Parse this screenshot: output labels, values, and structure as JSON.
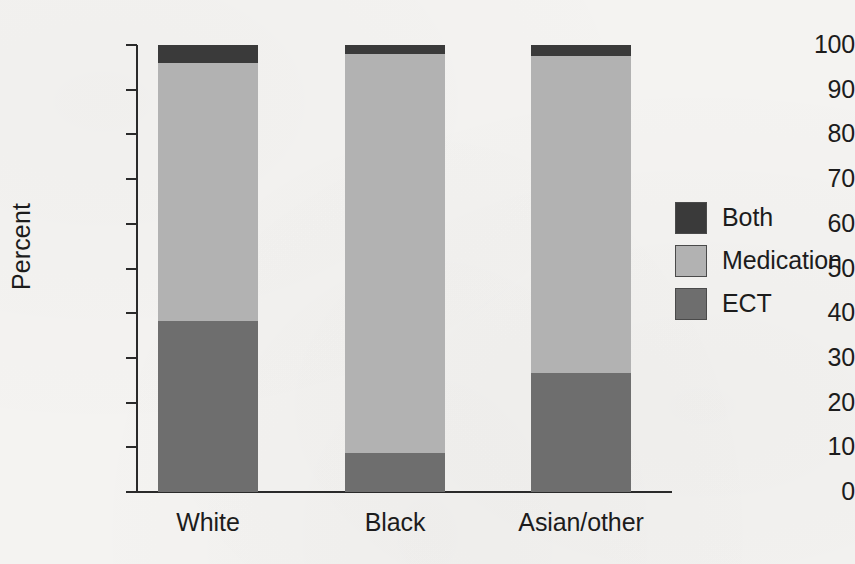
{
  "chart_data": {
    "type": "bar",
    "subtype": "stacked-bar-100",
    "title": "",
    "xlabel": "",
    "ylabel": "Percent",
    "ylim": [
      0,
      100
    ],
    "yticks": [
      0,
      10,
      20,
      30,
      40,
      50,
      60,
      70,
      80,
      90,
      100
    ],
    "ytick_labels": [
      "0",
      "10",
      "20",
      "30",
      "40",
      "50",
      "60",
      "70",
      "80",
      "90",
      "100"
    ],
    "grid": false,
    "legend_position": "right",
    "categories": [
      "White",
      "Black",
      "Asian/other"
    ],
    "series": [
      {
        "name": "ECT",
        "values": [
          38.3,
          8.7,
          26.6
        ],
        "color": "#6e6e6e"
      },
      {
        "name": "Medication",
        "values": [
          57.7,
          89.3,
          70.9
        ],
        "color": "#b2b2b2"
      },
      {
        "name": "Both",
        "values": [
          4.0,
          2.0,
          2.5
        ],
        "color": "#3a3a3a"
      }
    ],
    "stack_order_bottom_to_top": [
      "ECT",
      "Medication",
      "Both"
    ],
    "annotations": []
  },
  "legend": {
    "items": [
      {
        "label": "Both",
        "color": "#3a3a3a"
      },
      {
        "label": "Medication",
        "color": "#b2b2b2"
      },
      {
        "label": "ECT",
        "color": "#6e6e6e"
      }
    ]
  },
  "colors": {
    "background": "#f4f3f1",
    "axis": "#2a2a2a",
    "text": "#1c1c1c"
  }
}
